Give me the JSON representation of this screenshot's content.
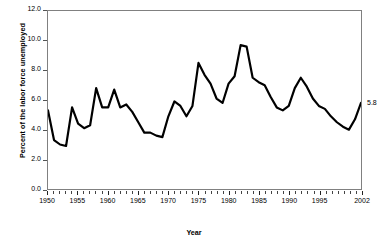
{
  "chart_data": {
    "type": "line",
    "title": "",
    "xlabel": "Year",
    "ylabel": "Percent of the labor force unemployed",
    "xlim": [
      1950,
      2002
    ],
    "ylim": [
      0.0,
      12.0
    ],
    "grid": false,
    "legend": null,
    "ytick_labels": [
      "12.0",
      "10.0",
      "8.0",
      "6.0",
      "4.0",
      "2.0",
      "0.0"
    ],
    "ytick_values": [
      12.0,
      10.0,
      8.0,
      6.0,
      4.0,
      2.0,
      0.0
    ],
    "xtick_labels": [
      "1950",
      "1955",
      "1960",
      "1965",
      "1970",
      "1975",
      "1980",
      "1985",
      "1990",
      "1995",
      "2002"
    ],
    "xtick_values": [
      1950,
      1955,
      1960,
      1965,
      1970,
      1975,
      1980,
      1985,
      1990,
      1995,
      2002
    ],
    "minor_xticks_every": 1,
    "line_color": "#000000",
    "line_width": 2.2,
    "annotations": [
      {
        "text": "5.8",
        "x": 2002,
        "y": 5.8,
        "position": "right-of-endpoint"
      }
    ],
    "x": [
      1950,
      1951,
      1952,
      1953,
      1954,
      1955,
      1956,
      1957,
      1958,
      1959,
      1960,
      1961,
      1962,
      1963,
      1964,
      1965,
      1966,
      1967,
      1968,
      1969,
      1970,
      1971,
      1972,
      1973,
      1974,
      1975,
      1976,
      1977,
      1978,
      1979,
      1980,
      1981,
      1982,
      1983,
      1984,
      1985,
      1986,
      1987,
      1988,
      1989,
      1990,
      1991,
      1992,
      1993,
      1994,
      1995,
      1996,
      1997,
      1998,
      1999,
      2000,
      2001,
      2002
    ],
    "values": [
      5.3,
      3.3,
      3.0,
      2.9,
      5.5,
      4.4,
      4.1,
      4.3,
      6.8,
      5.5,
      5.5,
      6.7,
      5.5,
      5.7,
      5.2,
      4.5,
      3.8,
      3.8,
      3.6,
      3.5,
      4.9,
      5.9,
      5.6,
      4.9,
      5.6,
      8.5,
      7.7,
      7.1,
      6.1,
      5.8,
      7.1,
      7.6,
      9.7,
      9.6,
      7.5,
      7.2,
      7.0,
      6.2,
      5.5,
      5.3,
      5.6,
      6.8,
      7.5,
      6.9,
      6.1,
      5.6,
      5.4,
      4.9,
      4.5,
      4.2,
      4.0,
      4.7,
      5.8
    ]
  }
}
